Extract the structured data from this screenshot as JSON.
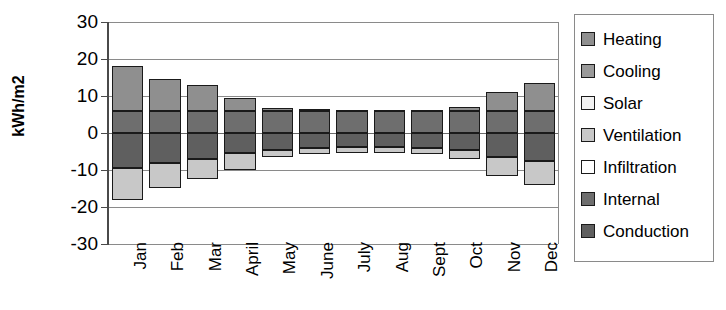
{
  "chart_data": {
    "type": "bar",
    "subtype": "stacked-bar-diverging",
    "title": "",
    "xlabel": "",
    "ylabel": "kWh/m2",
    "ylim": [
      -30,
      30
    ],
    "yticks": [
      30,
      20,
      10,
      0,
      -10,
      -20,
      -30
    ],
    "ytick_labels": [
      "30",
      "20",
      "10",
      "0",
      "-10",
      "-20",
      "-30"
    ],
    "grid": true,
    "legend_position": "right",
    "categories": [
      "Jan",
      "Feb",
      "Mar",
      "April",
      "May",
      "June",
      "July",
      "Aug",
      "Sept",
      "Oct",
      "Nov",
      "Dec"
    ],
    "series": [
      {
        "name": "Heating",
        "color": "#8f8f8f",
        "values": [
          12.0,
          8.5,
          7.0,
          3.5,
          0.8,
          0.4,
          0.2,
          0.2,
          0.3,
          1.0,
          5.0,
          7.5
        ]
      },
      {
        "name": "Cooling",
        "color": "#9a9a9a",
        "values": [
          0.0,
          0.0,
          0.0,
          0.0,
          0.0,
          0.0,
          0.0,
          0.0,
          0.0,
          0.0,
          0.0,
          0.0
        ]
      },
      {
        "name": "Solar",
        "color": "#f2f2f2",
        "values": [
          0.0,
          0.0,
          0.0,
          0.0,
          0.0,
          0.0,
          0.0,
          0.0,
          0.0,
          0.0,
          0.0,
          0.0
        ]
      },
      {
        "name": "Ventilation",
        "color": "#c8c8c8",
        "values": [
          -8.5,
          -7.0,
          -5.5,
          -4.5,
          -2.0,
          -1.8,
          -1.6,
          -1.6,
          -1.8,
          -2.5,
          -5.0,
          -6.5
        ]
      },
      {
        "name": "Infiltration",
        "color": "#ffffff",
        "values": [
          0.0,
          0.0,
          0.0,
          0.0,
          0.0,
          0.0,
          0.0,
          0.0,
          0.0,
          0.0,
          0.0,
          0.0
        ]
      },
      {
        "name": "Internal",
        "color": "#6e6e6e",
        "values": [
          6.0,
          6.0,
          6.0,
          6.0,
          6.0,
          6.0,
          6.0,
          6.0,
          6.0,
          6.0,
          6.0,
          6.0
        ]
      },
      {
        "name": "Conduction",
        "color": "#5f5f5f",
        "values": [
          -9.5,
          -8.0,
          -7.0,
          -5.5,
          -4.5,
          -4.0,
          -3.8,
          -3.8,
          -4.0,
          -4.5,
          -6.5,
          -7.5
        ]
      }
    ],
    "stack_positive_order": [
      "Internal",
      "Heating"
    ],
    "stack_negative_order": [
      "Conduction",
      "Ventilation"
    ],
    "bar_tops": [
      18.0,
      14.5,
      13.0,
      9.5,
      6.8,
      6.4,
      6.2,
      6.2,
      6.3,
      7.0,
      11.0,
      13.5
    ],
    "bar_bottoms": [
      -18.0,
      -15.0,
      -12.5,
      -10.0,
      -6.5,
      -5.8,
      -5.4,
      -5.4,
      -5.8,
      -7.0,
      -11.5,
      -14.0
    ]
  },
  "axis": {
    "y_title": "kWh/m2",
    "y_tick_labels": [
      "30",
      "20",
      "10",
      "0",
      "-10",
      "-20",
      "-30"
    ],
    "x_tick_labels": [
      "Jan",
      "Feb",
      "Mar",
      "April",
      "May",
      "June",
      "July",
      "Aug",
      "Sept",
      "Oct",
      "Nov",
      "Dec"
    ]
  },
  "legend": {
    "items": [
      {
        "label": "Heating",
        "color": "#8f8f8f"
      },
      {
        "label": "Cooling",
        "color": "#9a9a9a"
      },
      {
        "label": "Solar",
        "color": "#f2f2f2"
      },
      {
        "label": "Ventilation",
        "color": "#c8c8c8"
      },
      {
        "label": "Infiltration",
        "color": "#ffffff"
      },
      {
        "label": "Internal",
        "color": "#6e6e6e"
      },
      {
        "label": "Conduction",
        "color": "#5f5f5f"
      }
    ]
  }
}
